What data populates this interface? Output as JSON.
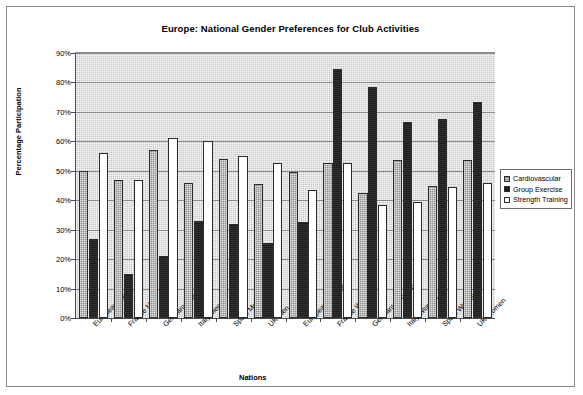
{
  "chart_data": {
    "type": "bar",
    "title": "Europe: National Gender Preferences for Club Activities",
    "xlabel": "Nations",
    "ylabel": "Percentage Participation",
    "ylim": [
      0,
      90
    ],
    "ytick_labels": [
      "0%",
      "10%",
      "20%",
      "30%",
      "40%",
      "50%",
      "60%",
      "70%",
      "80%",
      "90%"
    ],
    "ytick_values": [
      0,
      10,
      20,
      30,
      40,
      50,
      60,
      70,
      80,
      90
    ],
    "grid": true,
    "legend_position": "right",
    "categories": [
      "European Men",
      "France Men",
      "Germany Men",
      "Italy Men",
      "Spain Men",
      "UK Men",
      "European Women",
      "France Women",
      "Germany Women",
      "Italy Women",
      "Spain Women",
      "UK Women"
    ],
    "series": [
      {
        "name": "Cardiovascular",
        "color": "#8f8f8f",
        "values": [
          50,
          47,
          57,
          46,
          54,
          45.5,
          49.5,
          52.5,
          42.5,
          53.5,
          45,
          53.5
        ]
      },
      {
        "name": "Group Exercise",
        "color": "#1c1c1c",
        "values": [
          27,
          15,
          21,
          33,
          32,
          25.5,
          32.5,
          84.5,
          78.5,
          66.5,
          67.5,
          73.5
        ]
      },
      {
        "name": "Strength Training",
        "color": "#ffffff",
        "values": [
          56,
          47,
          61,
          60,
          55,
          52.5,
          43.5,
          52.5,
          38.5,
          39.5,
          44.5,
          46
        ]
      }
    ]
  },
  "legend": {
    "items": [
      {
        "label": "Cardiovascular",
        "swatch": "cardio"
      },
      {
        "label": "Group Exercise",
        "swatch": "group"
      },
      {
        "label": "Strength Training",
        "swatch": "strength"
      }
    ]
  }
}
